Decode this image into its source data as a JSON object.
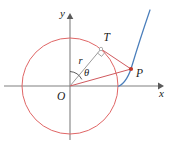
{
  "figure": {
    "background_color": "#ffffff"
  },
  "axes": {
    "x_label": "x",
    "y_label": "y",
    "origin_label": "O",
    "axis_color": "#808080",
    "origin_px": {
      "x": 70,
      "y": 86
    },
    "x_axis": {
      "x1": 4,
      "y1": 86,
      "x2": 163,
      "y2": 86
    },
    "y_axis": {
      "x1": 70,
      "y1": 138,
      "x2": 70,
      "y2": 14
    },
    "x_label_pos": {
      "x": 160,
      "y": 95
    },
    "y_label_pos": {
      "x": 61,
      "y": 14
    },
    "origin_label_pos": {
      "x": 59,
      "y": 98
    }
  },
  "circle": {
    "label": "base-circle",
    "color": "#e06666",
    "center": {
      "x": 70,
      "y": 86
    },
    "radius": 48,
    "stroke_width": 1
  },
  "curve": {
    "label": "involute-curve",
    "color": "#4a7ebb",
    "stroke_width": 1.2,
    "path": "M 150 10 C 143 30 136 52 132 68 C 129 78 126 84 118 86"
  },
  "radius_segment": {
    "label": "r",
    "label_text": "r",
    "color": "#9a9a9a",
    "from": {
      "x": 70,
      "y": 86
    },
    "to": {
      "x": 101,
      "y": 49
    },
    "label_pos": {
      "x": 79,
      "y": 62
    }
  },
  "tangent_segment": {
    "label": "tangent-T-to-P",
    "color": "#d0595e",
    "from": {
      "x": 101,
      "y": 49
    },
    "to": {
      "x": 131,
      "y": 69
    }
  },
  "chord_segment": {
    "label": "chord-O-to-P",
    "color": "#d0595e",
    "from": {
      "x": 70,
      "y": 86
    },
    "to": {
      "x": 131,
      "y": 69
    }
  },
  "angle": {
    "label_text": "θ",
    "label_pos": {
      "x": 85,
      "y": 73
    },
    "arc_color": "#4a4a4a",
    "arc_path": "M 70 72 A 14 14 0 0 1 81 79"
  },
  "right_angle": {
    "label": "right-angle-marker-at-T",
    "color": "#9a9a9a",
    "path": "M 98.4 52.7 L 101.9 55.6 L 104.6 52.4"
  },
  "points": [
    {
      "name": "point-T",
      "label": "T",
      "x": 101,
      "y": 49,
      "label_x": 104,
      "label_y": 40,
      "dot_color": "#9a9a9a",
      "dot_r": 1.6
    },
    {
      "name": "point-P",
      "label": "P",
      "x": 131,
      "y": 69,
      "label_x": 136,
      "label_y": 76,
      "dot_color": "#c0392b",
      "dot_r": 2.0
    }
  ],
  "colors": {
    "circle_red": "#e06666",
    "line_red": "#d0595e",
    "curve_blue": "#4a7ebb",
    "axis_gray": "#808080",
    "text_dark": "#1a1a1a"
  }
}
